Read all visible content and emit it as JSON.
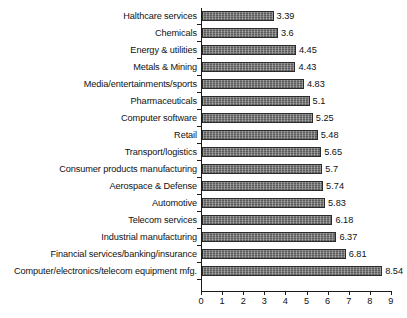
{
  "chart_data": {
    "type": "bar",
    "orientation": "horizontal",
    "title": "",
    "subtitle": "",
    "xlabel": "",
    "ylabel": "",
    "xlim": [
      0,
      9
    ],
    "grid": false,
    "legend": null,
    "legend_position": "none",
    "value_labels_shown": true,
    "axis_ticks": [
      "0",
      "1",
      "2",
      "3",
      "4",
      "5",
      "6",
      "7",
      "8",
      "9"
    ],
    "categories": [
      "Halthcare services",
      "Chemicals",
      "Energy & utilities",
      "Metals & Mining",
      "Media/entertainments/sports",
      "Pharmaceuticals",
      "Computer software",
      "Retail",
      "Transport/logistics",
      "Consumer products manufacturing",
      "Aerospace & Defense",
      "Automotive",
      "Telecom services",
      "Industrial manufacturing",
      "Financial services/banking/insurance",
      "Computer/electronics/telecom equipment mfg."
    ],
    "values": [
      3.39,
      3.6,
      4.45,
      4.43,
      4.83,
      5.1,
      5.25,
      5.48,
      5.65,
      5.7,
      5.74,
      5.83,
      6.18,
      6.37,
      6.81,
      8.54
    ],
    "value_labels": [
      "3.39",
      "3.6",
      "4.45",
      "4.43",
      "4.83",
      "5.1",
      "5.25",
      "5.48",
      "5.65",
      "5.7",
      "5.74",
      "5.83",
      "6.18",
      "6.37",
      "6.81",
      "8.54"
    ],
    "colors": {
      "bar_fill": "#6e6e6e",
      "bar_border": "#2b2b2b",
      "axis": "#1a1a1a",
      "text": "#111111",
      "background": "#ffffff"
    }
  }
}
